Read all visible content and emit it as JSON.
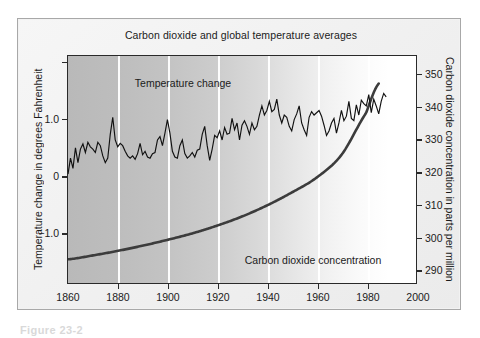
{
  "figure": {
    "caption": "Figure 23-2"
  },
  "chart_data": {
    "type": "line",
    "title": "Carbon dioxide and global temperature averages",
    "xlabel": "",
    "ylabel": "Temperature change in degrees Fahrenheit",
    "y2label": "Carbon dioxide concentration in parts per million",
    "xlim": [
      1860,
      2000
    ],
    "ylim": [
      -1.9,
      2.1
    ],
    "y2lim": [
      285.5,
      355.5
    ],
    "xticks": [
      1860,
      1880,
      1900,
      1920,
      1940,
      1960,
      1980,
      2000
    ],
    "xticklabels": [
      "1860",
      "1880",
      "1900",
      "1920",
      "1940",
      "1960",
      "1980",
      "2000"
    ],
    "yticks": [
      -1.0,
      0,
      1.0
    ],
    "yticklabels": [
      "−1.0",
      "0",
      "1.0"
    ],
    "y2ticks": [
      290,
      300,
      310,
      320,
      330,
      340,
      350
    ],
    "y2ticklabels": [
      "290",
      "300",
      "310",
      "320",
      "330",
      "340",
      "350"
    ],
    "grid": "vertical-white-at-xticks",
    "legend": "inline-annotations",
    "background": "horizontal gradient dark-gray (left) to white (right)",
    "annotations": [
      {
        "text": "Temperature change",
        "x": 1906,
        "y": 1.62
      },
      {
        "text": "Carbon dioxide concentration",
        "x": 1958,
        "y": -1.47
      }
    ],
    "series": [
      {
        "name": "Temperature change",
        "axis": "left",
        "units": "degrees Fahrenheit",
        "color": "#111111",
        "x": [
          1860,
          1861,
          1862,
          1863,
          1864,
          1865,
          1866,
          1867,
          1868,
          1869,
          1870,
          1871,
          1872,
          1873,
          1874,
          1875,
          1876,
          1877,
          1878,
          1879,
          1880,
          1881,
          1882,
          1883,
          1884,
          1885,
          1886,
          1887,
          1888,
          1889,
          1890,
          1891,
          1892,
          1893,
          1894,
          1895,
          1896,
          1897,
          1898,
          1899,
          1900,
          1901,
          1902,
          1903,
          1904,
          1905,
          1906,
          1907,
          1908,
          1909,
          1910,
          1911,
          1912,
          1913,
          1914,
          1915,
          1916,
          1917,
          1918,
          1919,
          1920,
          1921,
          1922,
          1923,
          1924,
          1925,
          1926,
          1927,
          1928,
          1929,
          1930,
          1931,
          1932,
          1933,
          1934,
          1935,
          1936,
          1937,
          1938,
          1939,
          1940,
          1941,
          1942,
          1943,
          1944,
          1945,
          1946,
          1947,
          1948,
          1949,
          1950,
          1951,
          1952,
          1953,
          1954,
          1955,
          1956,
          1957,
          1958,
          1959,
          1960,
          1961,
          1962,
          1963,
          1964,
          1965,
          1966,
          1967,
          1968,
          1969,
          1970,
          1971,
          1972,
          1973,
          1974,
          1975,
          1976,
          1977,
          1978,
          1979,
          1980,
          1981,
          1982,
          1983,
          1984,
          1985,
          1986,
          1987,
          1988
        ],
        "y": [
          0.02,
          0.3,
          0.12,
          0.48,
          0.22,
          0.46,
          0.55,
          0.4,
          0.58,
          0.5,
          0.46,
          0.4,
          0.58,
          0.52,
          0.34,
          0.22,
          0.3,
          0.72,
          1.02,
          0.62,
          0.5,
          0.56,
          0.52,
          0.42,
          0.34,
          0.3,
          0.34,
          0.28,
          0.38,
          0.56,
          0.36,
          0.42,
          0.32,
          0.3,
          0.38,
          0.4,
          0.62,
          0.68,
          0.52,
          0.74,
          0.98,
          0.74,
          0.42,
          0.32,
          0.3,
          0.52,
          0.62,
          0.38,
          0.3,
          0.34,
          0.4,
          0.32,
          0.44,
          0.46,
          0.72,
          0.86,
          0.52,
          0.26,
          0.46,
          0.7,
          0.66,
          0.78,
          0.62,
          0.84,
          0.72,
          0.74,
          1.0,
          0.8,
          0.92,
          0.62,
          0.88,
          0.96,
          0.86,
          0.72,
          0.92,
          0.8,
          0.86,
          1.06,
          1.22,
          1.06,
          1.14,
          1.3,
          1.12,
          1.16,
          1.34,
          1.06,
          0.92,
          1.06,
          1.02,
          0.86,
          0.78,
          0.98,
          1.08,
          1.22,
          0.92,
          0.8,
          0.7,
          1.02,
          1.12,
          1.06,
          1.1,
          1.14,
          1.04,
          0.88,
          0.7,
          0.78,
          0.92,
          1.0,
          0.74,
          0.92,
          1.14,
          0.96,
          1.04,
          1.3,
          1.0,
          0.96,
          1.24,
          1.06,
          1.32,
          1.26,
          1.22,
          1.42,
          1.1,
          1.34,
          1.22,
          1.08,
          1.3,
          1.44,
          1.38
        ]
      },
      {
        "name": "Carbon dioxide concentration",
        "axis": "right",
        "units": "parts per million",
        "color": "#3c3c3c",
        "x": [
          1860,
          1870,
          1880,
          1890,
          1900,
          1910,
          1920,
          1930,
          1940,
          1950,
          1960,
          1970,
          1980,
          1985
        ],
        "y": [
          292.8,
          294.0,
          295.4,
          297.0,
          298.8,
          300.8,
          303.2,
          306.0,
          309.4,
          313.4,
          318.0,
          325.0,
          338.0,
          347.0
        ]
      }
    ]
  }
}
